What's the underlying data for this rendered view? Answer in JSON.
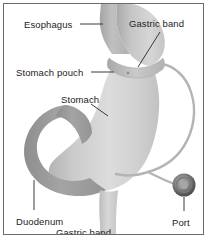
{
  "figure": {
    "border_color": "#6b6b6b",
    "background_color": "#ffffff"
  },
  "labels": {
    "esophagus": "Esophagus",
    "gastric_band_top": "Gastric band",
    "stomach_pouch": "Stomach pouch",
    "stomach": "Stomach",
    "duodenum": "Duodenum",
    "gastric_band_bottom": "Gastric band",
    "port": "Port"
  },
  "anatomy": {
    "esophagus": {
      "name": "esophagus",
      "fill": "#b9b9b9"
    },
    "stomach_pouch": {
      "name": "stomach-pouch",
      "fill": "#c4c4c4"
    },
    "stomach_body": {
      "name": "stomach-body",
      "fill": "#d3d3d3"
    },
    "duodenum": {
      "name": "duodenum",
      "fill": "#9d9d9d"
    },
    "pylorus_outlet": {
      "name": "pylorus-outlet",
      "fill": "#cfcfcf"
    },
    "gastric_band": {
      "name": "gastric-band",
      "fill": "#b5b5b5"
    },
    "connecting_tube": {
      "name": "connecting-tube",
      "stroke": "#b0b0b0"
    },
    "port": {
      "name": "access-port",
      "outer_fill": "#4a4a4a",
      "inner_fill": "#9a9a9a"
    }
  },
  "leader_lines": {
    "color": "#3a3a3a",
    "count": 6
  }
}
